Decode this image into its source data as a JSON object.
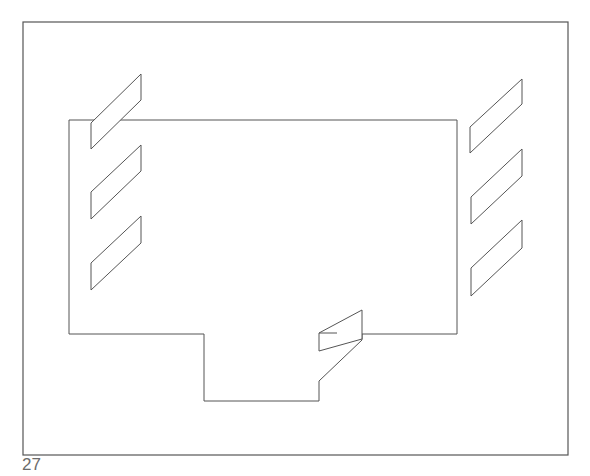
{
  "page": {
    "number": "27"
  },
  "style": {
    "stroke": "#555555",
    "background": "#ffffff"
  },
  "diagram": {
    "frame": {
      "x": 23,
      "y": 22,
      "w": 545,
      "h": 433
    },
    "outline_points": "69,120 457,120 457,334 362,334 362,340 319,381 319,401 204,401 204,334 69,334",
    "left_bars": [
      "91,123 141,74 141,100 91,149",
      "91,192 141,145 141,171 91,219",
      "91,263 141,216 141,243 91,290"
    ],
    "right_bars": [
      "470,127 522,79 522,104 470,153",
      "471,197 522,149 522,176 471,224",
      "471,268 522,220 522,248 471,296"
    ],
    "bottom_bar": "319,333 362,310 362,339 319,351"
  }
}
